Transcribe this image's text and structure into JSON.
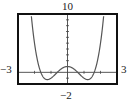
{
  "chart_data": {
    "type": "line",
    "title": "",
    "xlabel": "",
    "ylabel": "",
    "xlim": [
      -3,
      3
    ],
    "ylim": [
      -2,
      10
    ],
    "window_labels": {
      "ymax": "10",
      "ymin": "−2",
      "xmin": "−3",
      "xmax": "3"
    },
    "x_tick_step": 1,
    "y_tick_step": 1,
    "grid": false,
    "legend": null,
    "series": [
      {
        "name": "f(x) = x^4 - 3x^2 + 1",
        "x": [
          -1.86,
          -1.75,
          -1.618,
          -1.5,
          -1.4,
          -1.225,
          -1.0,
          -0.8,
          -0.618,
          -0.4,
          -0.2,
          0,
          0.2,
          0.4,
          0.618,
          0.8,
          1.0,
          1.225,
          1.4,
          1.5,
          1.618,
          1.75,
          1.86
        ],
        "values": [
          10.6,
          1.19,
          0.0,
          -0.69,
          -1.04,
          -1.25,
          -1.0,
          -0.51,
          0.0,
          0.54,
          0.88,
          1.0,
          0.88,
          0.54,
          0.0,
          -0.51,
          -1.0,
          -1.25,
          -1.04,
          -0.69,
          0.0,
          1.19,
          10.6
        ]
      }
    ],
    "colors": {
      "curve": "#555555",
      "frame": "#111111",
      "axis": "#444444"
    }
  }
}
